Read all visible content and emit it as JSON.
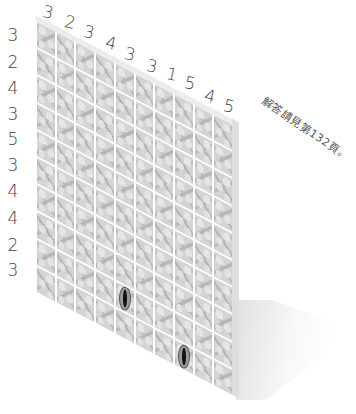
{
  "puzzle": {
    "type": "skyscraper-style wall grid",
    "size": 10,
    "top_clues": [
      "3",
      "2",
      "3",
      "4",
      "3",
      "3",
      "1",
      "5",
      "4",
      "5"
    ],
    "left_clues": [
      "3",
      "2",
      "4",
      "3",
      "5",
      "3",
      "4",
      "4",
      "2",
      "3"
    ],
    "marked_cells": [
      {
        "row": 8,
        "col": 4,
        "symbol": "eye"
      },
      {
        "row": 9,
        "col": 7,
        "symbol": "eye"
      }
    ],
    "note": "解答請見第132頁。"
  },
  "colors": {
    "tile_base": "#d4d4d4",
    "tile_pattern": "#b6b6b6",
    "grid_lines": "#ffffff",
    "clue_text": "#444444"
  }
}
